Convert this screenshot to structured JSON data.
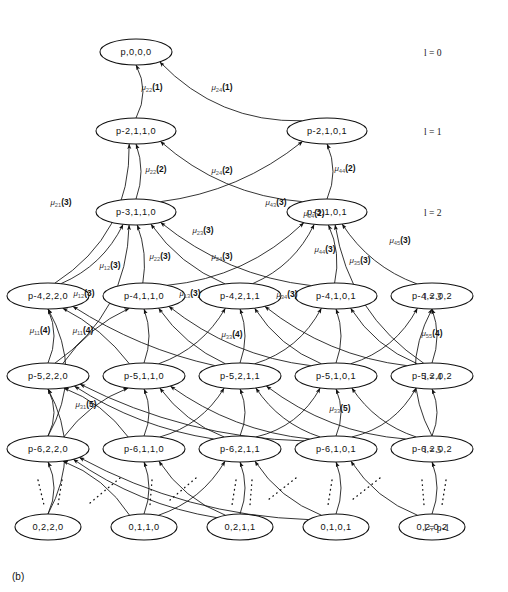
{
  "figure": {
    "caption": "(b)",
    "type": "state-transition-trellis-diagram"
  },
  "levels": [
    {
      "id": "l0",
      "label": "l = 0",
      "symbol": "l",
      "value": "0",
      "y": 52
    },
    {
      "id": "l1",
      "label": "l = 1",
      "symbol": "l",
      "value": "1",
      "y": 131
    },
    {
      "id": "l2",
      "label": "l = 2",
      "symbol": "l",
      "value": "2",
      "y": 212
    },
    {
      "id": "l3",
      "label": "l = 3",
      "symbol": "l",
      "value": "3",
      "y": 296
    },
    {
      "id": "l4",
      "label": "l = 4",
      "symbol": "l",
      "value": "4",
      "y": 376
    },
    {
      "id": "l5",
      "label": "l = 5",
      "symbol": "l",
      "value": "5",
      "y": 449
    },
    {
      "id": "lp",
      "label": "l = p-1",
      "symbol": "l",
      "value": "p-1",
      "y": 527
    }
  ],
  "level_label_x": 424,
  "nodes": [
    {
      "id": "n0",
      "label": "p,0,0,0",
      "x": 136,
      "y": 52,
      "rx": 36,
      "ry": 13,
      "level": "l0"
    },
    {
      "id": "n10",
      "label": "p-2,1,1,0",
      "x": 136,
      "y": 131,
      "rx": 40,
      "ry": 13,
      "level": "l1"
    },
    {
      "id": "n11",
      "label": "p-2,1,0,1",
      "x": 327,
      "y": 131,
      "rx": 40,
      "ry": 13,
      "level": "l1"
    },
    {
      "id": "n20",
      "label": "p-3,1,1,0",
      "x": 136,
      "y": 212,
      "rx": 40,
      "ry": 13,
      "level": "l2"
    },
    {
      "id": "n21",
      "label": "p-3,1,0,1",
      "x": 327,
      "y": 212,
      "rx": 40,
      "ry": 13,
      "level": "l2"
    },
    {
      "id": "n30",
      "label": "p-4,2,2,0",
      "x": 48,
      "y": 296,
      "rx": 41,
      "ry": 13,
      "level": "l3"
    },
    {
      "id": "n31",
      "label": "p-4,1,1,0",
      "x": 144,
      "y": 296,
      "rx": 41,
      "ry": 13,
      "level": "l3"
    },
    {
      "id": "n32",
      "label": "p-4,2,1,1",
      "x": 240,
      "y": 296,
      "rx": 41,
      "ry": 13,
      "level": "l3"
    },
    {
      "id": "n33",
      "label": "p-4,1,0,1",
      "x": 336,
      "y": 296,
      "rx": 41,
      "ry": 13,
      "level": "l3"
    },
    {
      "id": "n34",
      "label": "p-4,2,0,2",
      "x": 432,
      "y": 296,
      "rx": 41,
      "ry": 13,
      "level": "l3"
    },
    {
      "id": "n40",
      "label": "p-5,2,2,0",
      "x": 48,
      "y": 376,
      "rx": 41,
      "ry": 13,
      "level": "l4"
    },
    {
      "id": "n41",
      "label": "p-5,1,1,0",
      "x": 144,
      "y": 376,
      "rx": 41,
      "ry": 13,
      "level": "l4"
    },
    {
      "id": "n42",
      "label": "p-5,2,1,1",
      "x": 240,
      "y": 376,
      "rx": 41,
      "ry": 13,
      "level": "l4"
    },
    {
      "id": "n43",
      "label": "p-5,1,0,1",
      "x": 336,
      "y": 376,
      "rx": 41,
      "ry": 13,
      "level": "l4"
    },
    {
      "id": "n44",
      "label": "p-5,2,0,2",
      "x": 432,
      "y": 376,
      "rx": 41,
      "ry": 13,
      "level": "l4"
    },
    {
      "id": "n50",
      "label": "p-6,2,2,0",
      "x": 48,
      "y": 449,
      "rx": 41,
      "ry": 13,
      "level": "l5"
    },
    {
      "id": "n51",
      "label": "p-6,1,1,0",
      "x": 144,
      "y": 449,
      "rx": 41,
      "ry": 13,
      "level": "l5"
    },
    {
      "id": "n52",
      "label": "p-6,2,1,1",
      "x": 240,
      "y": 449,
      "rx": 41,
      "ry": 13,
      "level": "l5"
    },
    {
      "id": "n53",
      "label": "p-6,1,0,1",
      "x": 336,
      "y": 449,
      "rx": 41,
      "ry": 13,
      "level": "l5"
    },
    {
      "id": "n54",
      "label": "p-6,2,0,2",
      "x": 432,
      "y": 449,
      "rx": 41,
      "ry": 13,
      "level": "l5"
    },
    {
      "id": "n60",
      "label": "0,2,2,0",
      "x": 48,
      "y": 527,
      "rx": 33,
      "ry": 13,
      "level": "lp"
    },
    {
      "id": "n61",
      "label": "0,1,1,0",
      "x": 144,
      "y": 527,
      "rx": 33,
      "ry": 13,
      "level": "lp"
    },
    {
      "id": "n62",
      "label": "0,2,1,1",
      "x": 240,
      "y": 527,
      "rx": 33,
      "ry": 13,
      "level": "lp"
    },
    {
      "id": "n63",
      "label": "0,1,0,1",
      "x": 336,
      "y": 527,
      "rx": 33,
      "ry": 13,
      "level": "lp"
    },
    {
      "id": "n64",
      "label": "0,2,0,2",
      "x": 432,
      "y": 527,
      "rx": 33,
      "ry": 13,
      "level": "lp"
    }
  ],
  "edge_labels": [
    {
      "id": "el1",
      "mu": "μ",
      "sub": "22",
      "arg": "(1)",
      "x": 152,
      "y": 90
    },
    {
      "id": "el2",
      "mu": "μ",
      "sub": "24",
      "arg": "(1)",
      "x": 222,
      "y": 90
    },
    {
      "id": "el3",
      "mu": "μ",
      "sub": "22",
      "arg": "(2)",
      "x": 156,
      "y": 172
    },
    {
      "id": "el4",
      "mu": "μ",
      "sub": "24",
      "arg": "(2)",
      "x": 222,
      "y": 173
    },
    {
      "id": "el5",
      "mu": "μ",
      "sub": "44",
      "arg": "(2)",
      "x": 345,
      "y": 171
    },
    {
      "id": "el6",
      "mu": "μ",
      "sub": "34",
      "arg": "(2)",
      "x": 314,
      "y": 216
    },
    {
      "id": "el7",
      "mu": "μ",
      "sub": "43",
      "arg": "(3)",
      "x": 276,
      "y": 205
    },
    {
      "id": "el8",
      "mu": "μ",
      "sub": "21",
      "arg": "(3)",
      "x": 61,
      "y": 205
    },
    {
      "id": "el9",
      "mu": "μ",
      "sub": "12",
      "arg": "(3)",
      "x": 110,
      "y": 268
    },
    {
      "id": "el10",
      "mu": "μ",
      "sub": "22",
      "arg": "(3)",
      "x": 160,
      "y": 259
    },
    {
      "id": "el11",
      "mu": "μ",
      "sub": "23",
      "arg": "(3)",
      "x": 203,
      "y": 233
    },
    {
      "id": "el12",
      "mu": "μ",
      "sub": "24",
      "arg": "(3)",
      "x": 222,
      "y": 259
    },
    {
      "id": "el13",
      "mu": "μ",
      "sub": "44",
      "arg": "(3)",
      "x": 325,
      "y": 252
    },
    {
      "id": "el14",
      "mu": "μ",
      "sub": "35",
      "arg": "(3)",
      "x": 360,
      "y": 263
    },
    {
      "id": "el15",
      "mu": "μ",
      "sub": "45",
      "arg": "(3)",
      "x": 400,
      "y": 243
    },
    {
      "id": "el16",
      "mu": "μ",
      "sub": "12",
      "arg": "(3)",
      "x": 84,
      "y": 296
    },
    {
      "id": "el17",
      "mu": "μ",
      "sub": "13",
      "arg": "(3)",
      "x": 190,
      "y": 296
    },
    {
      "id": "el18",
      "mu": "μ",
      "sub": "34",
      "arg": "(3)",
      "x": 287,
      "y": 297
    },
    {
      "id": "el19",
      "mu": "μ",
      "sub": "11",
      "arg": "(4)",
      "x": 40,
      "y": 333
    },
    {
      "id": "el20",
      "mu": "μ",
      "sub": "11",
      "arg": "(4)",
      "x": 83,
      "y": 333
    },
    {
      "id": "el21",
      "mu": "μ",
      "sub": "33",
      "arg": "(4)",
      "x": 232,
      "y": 337
    },
    {
      "id": "el22",
      "mu": "μ",
      "sub": "55",
      "arg": "(4)",
      "x": 432,
      "y": 336
    },
    {
      "id": "el23",
      "mu": "μ",
      "sub": "31",
      "arg": "(5)",
      "x": 86,
      "y": 407
    },
    {
      "id": "el24",
      "mu": "μ",
      "sub": "33",
      "arg": "(5)",
      "x": 340,
      "y": 411
    }
  ],
  "edges": [
    {
      "from": "n10",
      "to": "n0",
      "curve": 14,
      "arrow": true
    },
    {
      "from": "n11",
      "to": "n0",
      "curve": -34,
      "arrow": true
    },
    {
      "from": "n20",
      "to": "n10",
      "curve": 10,
      "arrow": true
    },
    {
      "from": "n21",
      "to": "n10",
      "curve": -26,
      "arrow": true
    },
    {
      "from": "n21",
      "to": "n11",
      "curve": 12,
      "arrow": true
    },
    {
      "from": "n20",
      "to": "n11",
      "curve": 22,
      "arrow": true
    },
    {
      "from": "n30",
      "to": "n20",
      "curve": 16,
      "arrow": true
    },
    {
      "from": "n31",
      "to": "n20",
      "curve": 8,
      "arrow": true
    },
    {
      "from": "n32",
      "to": "n20",
      "curve": -14,
      "arrow": true
    },
    {
      "from": "n33",
      "to": "n20",
      "curve": -24,
      "arrow": true
    },
    {
      "from": "n32",
      "to": "n21",
      "curve": 16,
      "arrow": true
    },
    {
      "from": "n33",
      "to": "n21",
      "curve": 10,
      "arrow": true
    },
    {
      "from": "n34",
      "to": "n21",
      "curve": -16,
      "arrow": true
    },
    {
      "from": "n31",
      "to": "n21",
      "curve": 26,
      "arrow": true
    },
    {
      "from": "n30",
      "to": "n10",
      "curve": 44,
      "arrow": true
    },
    {
      "from": "n40",
      "to": "n30",
      "curve": 12,
      "arrow": true
    },
    {
      "from": "n41",
      "to": "n30",
      "curve": 10,
      "arrow": true
    },
    {
      "from": "n42",
      "to": "n30",
      "curve": -14,
      "arrow": true
    },
    {
      "from": "n40",
      "to": "n31",
      "curve": -12,
      "arrow": true
    },
    {
      "from": "n41",
      "to": "n31",
      "curve": 10,
      "arrow": true
    },
    {
      "from": "n42",
      "to": "n31",
      "curve": -12,
      "arrow": true
    },
    {
      "from": "n43",
      "to": "n31",
      "curve": -22,
      "arrow": true
    },
    {
      "from": "n42",
      "to": "n32",
      "curve": 10,
      "arrow": true
    },
    {
      "from": "n41",
      "to": "n32",
      "curve": 16,
      "arrow": true
    },
    {
      "from": "n43",
      "to": "n32",
      "curve": -14,
      "arrow": true
    },
    {
      "from": "n44",
      "to": "n32",
      "curve": -22,
      "arrow": true
    },
    {
      "from": "n43",
      "to": "n33",
      "curve": 10,
      "arrow": true
    },
    {
      "from": "n42",
      "to": "n33",
      "curve": 18,
      "arrow": true
    },
    {
      "from": "n44",
      "to": "n33",
      "curve": -14,
      "arrow": true
    },
    {
      "from": "n44",
      "to": "n34",
      "curve": 10,
      "arrow": true
    },
    {
      "from": "n43",
      "to": "n34",
      "curve": 18,
      "arrow": true
    },
    {
      "from": "n40",
      "to": "n20",
      "curve": 40,
      "arrow": true
    },
    {
      "from": "n44",
      "to": "n21",
      "curve": -36,
      "arrow": true
    },
    {
      "from": "n50",
      "to": "n40",
      "curve": 12,
      "arrow": true
    },
    {
      "from": "n51",
      "to": "n40",
      "curve": 12,
      "arrow": true
    },
    {
      "from": "n52",
      "to": "n40",
      "curve": -16,
      "arrow": true
    },
    {
      "from": "n53",
      "to": "n40",
      "curve": -26,
      "arrow": true
    },
    {
      "from": "n50",
      "to": "n41",
      "curve": -12,
      "arrow": true
    },
    {
      "from": "n51",
      "to": "n41",
      "curve": 10,
      "arrow": true
    },
    {
      "from": "n52",
      "to": "n41",
      "curve": -12,
      "arrow": true
    },
    {
      "from": "n53",
      "to": "n41",
      "curve": -20,
      "arrow": true
    },
    {
      "from": "n52",
      "to": "n42",
      "curve": 10,
      "arrow": true
    },
    {
      "from": "n51",
      "to": "n42",
      "curve": 16,
      "arrow": true
    },
    {
      "from": "n53",
      "to": "n42",
      "curve": -14,
      "arrow": true
    },
    {
      "from": "n54",
      "to": "n42",
      "curve": -22,
      "arrow": true
    },
    {
      "from": "n53",
      "to": "n43",
      "curve": 10,
      "arrow": true
    },
    {
      "from": "n52",
      "to": "n43",
      "curve": 18,
      "arrow": true
    },
    {
      "from": "n54",
      "to": "n43",
      "curve": -14,
      "arrow": true
    },
    {
      "from": "n54",
      "to": "n44",
      "curve": 10,
      "arrow": true
    },
    {
      "from": "n53",
      "to": "n44",
      "curve": 18,
      "arrow": true
    },
    {
      "from": "n50",
      "to": "n30",
      "curve": 36,
      "arrow": true
    },
    {
      "from": "n54",
      "to": "n34",
      "curve": -34,
      "arrow": true
    },
    {
      "from": "n60",
      "to": "n50",
      "curve": 12,
      "arrow": true
    },
    {
      "from": "n61",
      "to": "n50",
      "curve": 14,
      "arrow": true
    },
    {
      "from": "n62",
      "to": "n50",
      "curve": -18,
      "arrow": true
    },
    {
      "from": "n63",
      "to": "n50",
      "curve": -28,
      "arrow": true
    },
    {
      "from": "n61",
      "to": "n51",
      "curve": 10,
      "arrow": true
    },
    {
      "from": "n62",
      "to": "n51",
      "curve": -14,
      "arrow": true
    },
    {
      "from": "n62",
      "to": "n52",
      "curve": 10,
      "arrow": true
    },
    {
      "from": "n61",
      "to": "n52",
      "curve": 16,
      "arrow": true
    },
    {
      "from": "n63",
      "to": "n52",
      "curve": -14,
      "arrow": true
    },
    {
      "from": "n63",
      "to": "n53",
      "curve": 10,
      "arrow": true
    },
    {
      "from": "n64",
      "to": "n53",
      "curve": -14,
      "arrow": true
    },
    {
      "from": "n64",
      "to": "n54",
      "curve": 10,
      "arrow": true
    },
    {
      "from": "n60",
      "to": "n40",
      "curve": 34,
      "arrow": true
    }
  ],
  "dotted_edges": [
    {
      "x1": 62,
      "y1": 480,
      "x2": 58,
      "y2": 505
    },
    {
      "x1": 38,
      "y1": 480,
      "x2": 44,
      "y2": 505
    },
    {
      "x1": 120,
      "y1": 478,
      "x2": 90,
      "y2": 503
    },
    {
      "x1": 152,
      "y1": 480,
      "x2": 150,
      "y2": 505
    },
    {
      "x1": 196,
      "y1": 478,
      "x2": 170,
      "y2": 500
    },
    {
      "x1": 236,
      "y1": 480,
      "x2": 232,
      "y2": 505
    },
    {
      "x1": 252,
      "y1": 480,
      "x2": 250,
      "y2": 505
    },
    {
      "x1": 296,
      "y1": 478,
      "x2": 268,
      "y2": 500
    },
    {
      "x1": 332,
      "y1": 480,
      "x2": 328,
      "y2": 505
    },
    {
      "x1": 380,
      "y1": 478,
      "x2": 352,
      "y2": 500
    },
    {
      "x1": 422,
      "y1": 480,
      "x2": 424,
      "y2": 505
    },
    {
      "x1": 446,
      "y1": 480,
      "x2": 442,
      "y2": 505
    }
  ]
}
